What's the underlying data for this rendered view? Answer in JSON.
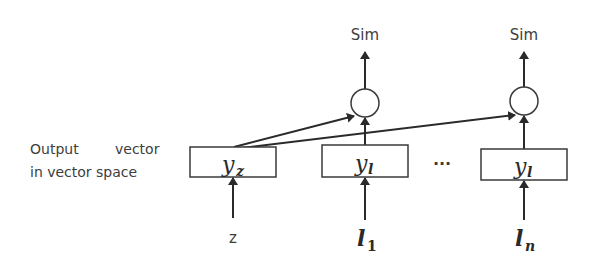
{
  "diagram": {
    "type": "neural-similarity-architecture",
    "side_label": {
      "line1_word1": "Output",
      "line1_word2": "vector",
      "line2": "in vector space"
    },
    "outputs": [
      {
        "label": "Sim"
      },
      {
        "label": "Sim"
      }
    ],
    "boxes": [
      {
        "var": "y",
        "sub": "z"
      },
      {
        "var": "y",
        "sub": "l"
      },
      {
        "var": "y",
        "sub": "l"
      }
    ],
    "inputs": [
      {
        "var": "z",
        "sub": ""
      },
      {
        "var": "l",
        "sub": "1"
      },
      {
        "var": "l",
        "sub": "n"
      }
    ],
    "ellipsis": "...",
    "colors": {
      "stroke": "#2a2a2a",
      "text": "#3d3d3d",
      "background": "#ffffff"
    }
  }
}
